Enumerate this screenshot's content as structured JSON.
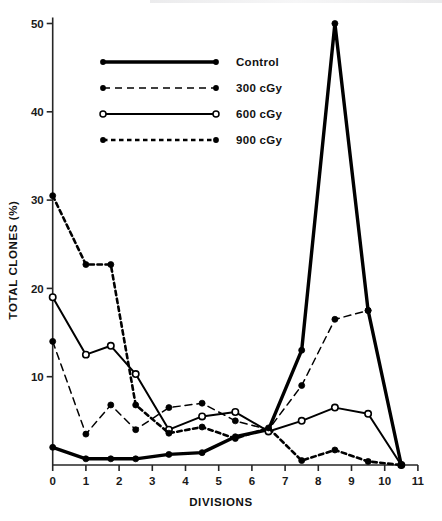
{
  "chart_data": {
    "type": "line",
    "title": "",
    "xlabel": "DIVISIONS",
    "ylabel": "TOTAL CLONES (%)",
    "xlim": [
      0,
      11
    ],
    "ylim": [
      0,
      50
    ],
    "xticks": [
      "0",
      "1",
      "2",
      "3",
      "4",
      "5",
      "6",
      "7",
      "8",
      "9",
      "10",
      "11"
    ],
    "xtick_values": [
      0,
      1,
      2,
      3,
      4,
      5,
      6,
      7,
      8,
      9,
      10,
      11
    ],
    "yticks": [
      "10",
      "20",
      "30",
      "40",
      "50"
    ],
    "ytick_values": [
      10,
      20,
      30,
      40,
      50
    ],
    "grid": false,
    "legend_position": "upper-center-left",
    "x": [
      0,
      1,
      1.75,
      2.5,
      3.5,
      4.5,
      5.5,
      6.5,
      7.5,
      8.5,
      9.5,
      10.5
    ],
    "series": [
      {
        "name": "Control",
        "style": "solid-thick",
        "marker": "filled-circle",
        "color": "#000000",
        "values": [
          2.0,
          0.7,
          0.7,
          0.7,
          1.2,
          1.4,
          3.2,
          4.0,
          13.0,
          50.0,
          17.5,
          0.0
        ]
      },
      {
        "name": "300 cGy",
        "style": "dashed-thin",
        "marker": "filled-circle",
        "color": "#000000",
        "values": [
          14.0,
          3.5,
          6.8,
          4.0,
          6.5,
          7.0,
          5.0,
          4.0,
          9.0,
          16.5,
          17.5,
          0.0
        ]
      },
      {
        "name": "600 cGy",
        "style": "solid-thin",
        "marker": "open-circle",
        "color": "#000000",
        "values": [
          19.0,
          12.5,
          13.5,
          10.3,
          4.0,
          5.5,
          6.0,
          3.8,
          5.0,
          6.5,
          5.8,
          0.0
        ]
      },
      {
        "name": "900 cGy",
        "style": "dotted-thick",
        "marker": "filled-circle",
        "color": "#000000",
        "values": [
          30.5,
          22.7,
          22.7,
          6.8,
          3.6,
          4.3,
          3.0,
          4.2,
          0.5,
          1.7,
          0.4,
          0.0
        ]
      }
    ]
  },
  "legend": {
    "items": [
      {
        "label": "Control"
      },
      {
        "label": "300 cGy"
      },
      {
        "label": "600 cGy"
      },
      {
        "label": "900 cGy"
      }
    ]
  },
  "axes": {
    "x_title": "DIVISIONS",
    "y_title": "TOTAL CLONES (%)"
  }
}
